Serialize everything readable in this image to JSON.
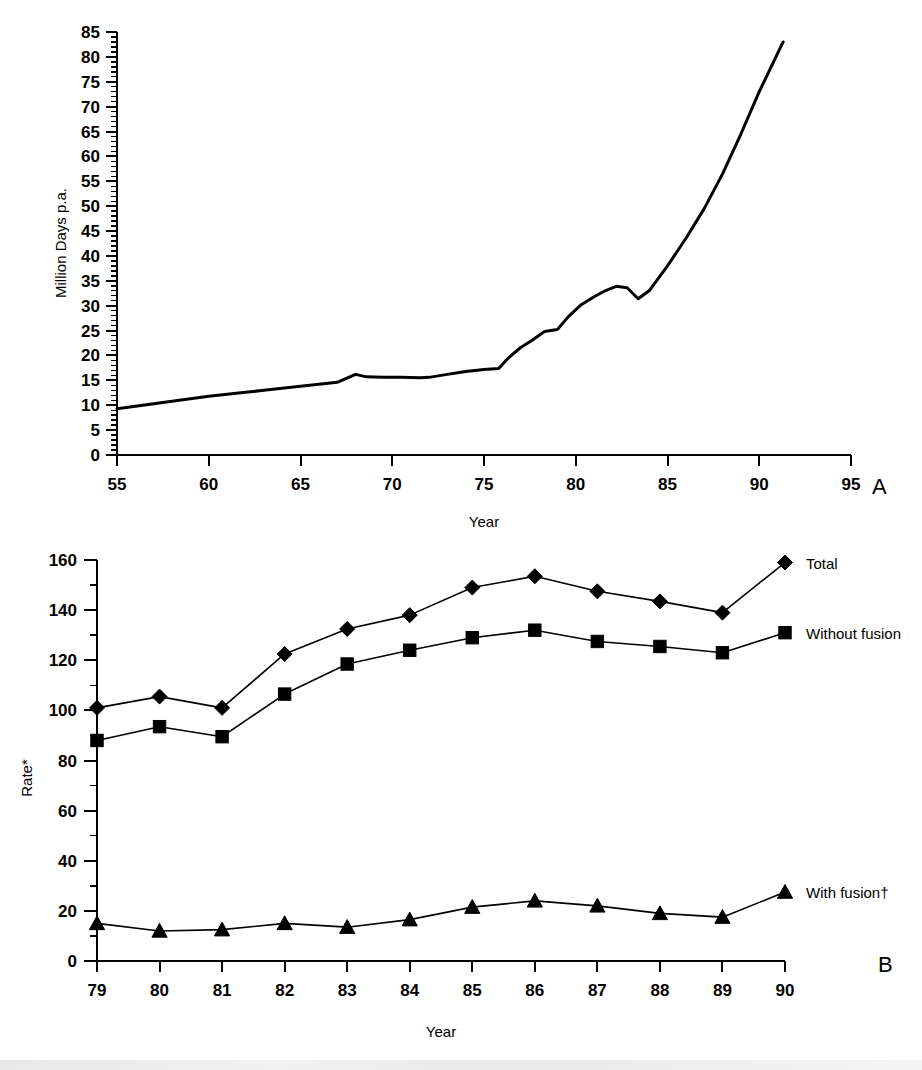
{
  "figure": {
    "panel_a_letter": "A",
    "panel_b_letter": "B"
  },
  "chart_data": [
    {
      "id": "panel_a",
      "type": "line",
      "title": "",
      "xlabel": "Year",
      "ylabel": "Million Days p.a.",
      "xlim": [
        55,
        95
      ],
      "ylim": [
        0,
        85
      ],
      "xticks": [
        55,
        60,
        65,
        70,
        75,
        80,
        85,
        90,
        95
      ],
      "xticklabels": [
        "55",
        "60",
        "65",
        "70",
        "75",
        "80",
        "85",
        "90",
        "95"
      ],
      "yticks": [
        0,
        5,
        10,
        15,
        20,
        25,
        30,
        35,
        40,
        45,
        50,
        55,
        60,
        65,
        70,
        75,
        80,
        85
      ],
      "yticklabels": [
        "0",
        "5",
        "10",
        "15",
        "20",
        "25",
        "30",
        "35",
        "40",
        "45",
        "50",
        "55",
        "60",
        "65",
        "70",
        "75",
        "80",
        "85"
      ],
      "y_minor_tick_step": 1,
      "grid": false,
      "legend": "none",
      "series": [
        {
          "name": "Certified incapacity",
          "x": [
            55,
            56,
            57,
            58,
            59,
            60,
            61,
            62,
            63,
            64,
            65,
            66,
            67,
            68,
            68.6,
            69.5,
            70.5,
            71.5,
            72,
            73,
            74,
            75,
            75.8,
            76.3,
            77,
            77.6,
            78.3,
            79,
            79.6,
            80.3,
            81,
            81.6,
            82.2,
            82.8,
            83.4,
            84,
            85,
            86,
            87,
            88,
            89,
            90,
            91.3
          ],
          "y": [
            9.3,
            9.8,
            10.3,
            10.8,
            11.3,
            11.8,
            12.2,
            12.6,
            13.0,
            13.4,
            13.8,
            14.2,
            14.6,
            16.2,
            15.7,
            15.6,
            15.6,
            15.5,
            15.6,
            16.2,
            16.8,
            17.2,
            17.4,
            19.4,
            21.6,
            23.0,
            24.8,
            25.2,
            27.8,
            30.2,
            31.8,
            33.0,
            33.9,
            33.6,
            31.4,
            33.0,
            38.0,
            43.5,
            49.5,
            56.5,
            64.5,
            73.0,
            83.0
          ]
        }
      ]
    },
    {
      "id": "panel_b",
      "type": "line",
      "title": "",
      "xlabel": "Year",
      "ylabel": "Rate*",
      "xlim": [
        79,
        90
      ],
      "ylim": [
        0,
        160
      ],
      "xticks": [
        79,
        80,
        81,
        82,
        83,
        84,
        85,
        86,
        87,
        88,
        89,
        90
      ],
      "xticklabels": [
        "79",
        "80",
        "81",
        "82",
        "83",
        "84",
        "85",
        "86",
        "87",
        "88",
        "89",
        "90"
      ],
      "yticks": [
        0,
        20,
        40,
        60,
        80,
        100,
        120,
        140,
        160
      ],
      "yticklabels": [
        "0",
        "20",
        "40",
        "60",
        "80",
        "100",
        "120",
        "140",
        "160"
      ],
      "y_minor_tick_step": 10,
      "grid": false,
      "legend_position": "right-inline",
      "categories": [
        "79",
        "80",
        "81",
        "82",
        "83",
        "84",
        "85",
        "86",
        "87",
        "88",
        "89",
        "90"
      ],
      "series": [
        {
          "name": "Total",
          "marker": "diamond",
          "label": "Total",
          "values": [
            101,
            105.5,
            101,
            122.5,
            132.5,
            138,
            149,
            153.5,
            147.5,
            143.5,
            139,
            159
          ]
        },
        {
          "name": "Without fusion",
          "marker": "square",
          "label": "Without fusion",
          "values": [
            88,
            93.5,
            89.5,
            106.5,
            118.5,
            124,
            129,
            132,
            127.5,
            125.5,
            123,
            131
          ]
        },
        {
          "name": "With fusion",
          "marker": "triangle",
          "label": "With fusion†",
          "values": [
            15,
            12,
            12.5,
            15,
            13.5,
            16.5,
            21.5,
            24,
            22,
            19,
            17.5,
            27.5
          ]
        }
      ]
    }
  ]
}
